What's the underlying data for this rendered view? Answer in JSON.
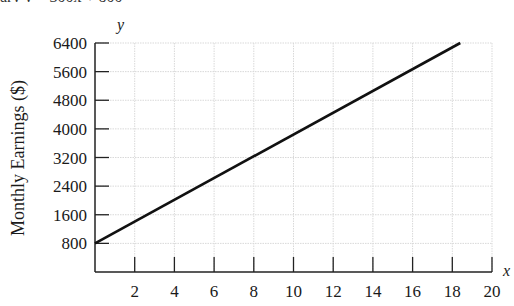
{
  "header": {
    "cut_off_text": "ary y = 300x + 800"
  },
  "chart_data": {
    "type": "line",
    "title": "",
    "xlabel": "x",
    "ylabel": "y",
    "y_axis_title": "Monthly Earnings ($)",
    "x_ticks": [
      2,
      4,
      6,
      8,
      10,
      12,
      14,
      16,
      18,
      20
    ],
    "y_ticks": [
      800,
      1600,
      2400,
      3200,
      4000,
      4800,
      5600,
      6400
    ],
    "xlim": [
      0,
      20
    ],
    "ylim": [
      0,
      6400
    ],
    "grid": true,
    "legend": null,
    "series": [
      {
        "name": "Monthly Earnings",
        "x": [
          0,
          18.4
        ],
        "y": [
          800,
          6400
        ]
      }
    ]
  },
  "colors": {
    "line": "#111111",
    "axis": "#222222",
    "grid": "#d9d9d9"
  }
}
